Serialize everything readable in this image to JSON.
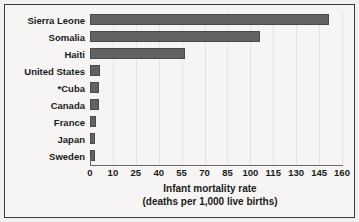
{
  "chart_data": {
    "type": "bar",
    "orientation": "horizontal",
    "title": "",
    "xlabel_line1": "Infant mortality rate",
    "xlabel_line2": "(deaths per 1,000 live births)",
    "ylabel": "",
    "grid": true,
    "legend": "none",
    "xlim": [
      0,
      160
    ],
    "tick_labels": [
      "0",
      "10",
      "25",
      "40",
      "55",
      "70",
      "85",
      "100",
      "115",
      "130",
      "145",
      "160"
    ],
    "tick_values": [
      0,
      10,
      25,
      40,
      55,
      70,
      85,
      100,
      115,
      130,
      145,
      160
    ],
    "axis_spacing": "equal-slot",
    "categories": [
      "Sierra Leone",
      "Somalia",
      "Haiti",
      "United States",
      "*Cuba",
      "Canada",
      "France",
      "Japan",
      "Sweden"
    ],
    "values": [
      157,
      113,
      57,
      7,
      6,
      5,
      4,
      3,
      3
    ],
    "bars": [
      {
        "label": "Sierra Leone",
        "value": 157,
        "slot_end": 10.45
      },
      {
        "label": "Somalia",
        "value": 113,
        "slot_end": 7.4
      },
      {
        "label": "Haiti",
        "value": 57,
        "slot_end": 4.13
      },
      {
        "label": "United States",
        "value": 7,
        "slot_end": 0.45
      },
      {
        "label": "*Cuba",
        "value": 6,
        "slot_end": 0.4
      },
      {
        "label": "Canada",
        "value": 5,
        "slot_end": 0.38
      },
      {
        "label": "France",
        "value": 4,
        "slot_end": 0.27
      },
      {
        "label": "Japan",
        "value": 3,
        "slot_end": 0.22
      },
      {
        "label": "Sweden",
        "value": 3,
        "slot_end": 0.2
      }
    ],
    "colors": {
      "bar_fill": "#626262",
      "bar_stroke": "#4a4a4a",
      "background": "#f6f5f3",
      "frame": "#3b3b3b",
      "gridline": "#e6e4e1",
      "axis": "#6b6b6b",
      "text": "#1a1a1a"
    }
  }
}
